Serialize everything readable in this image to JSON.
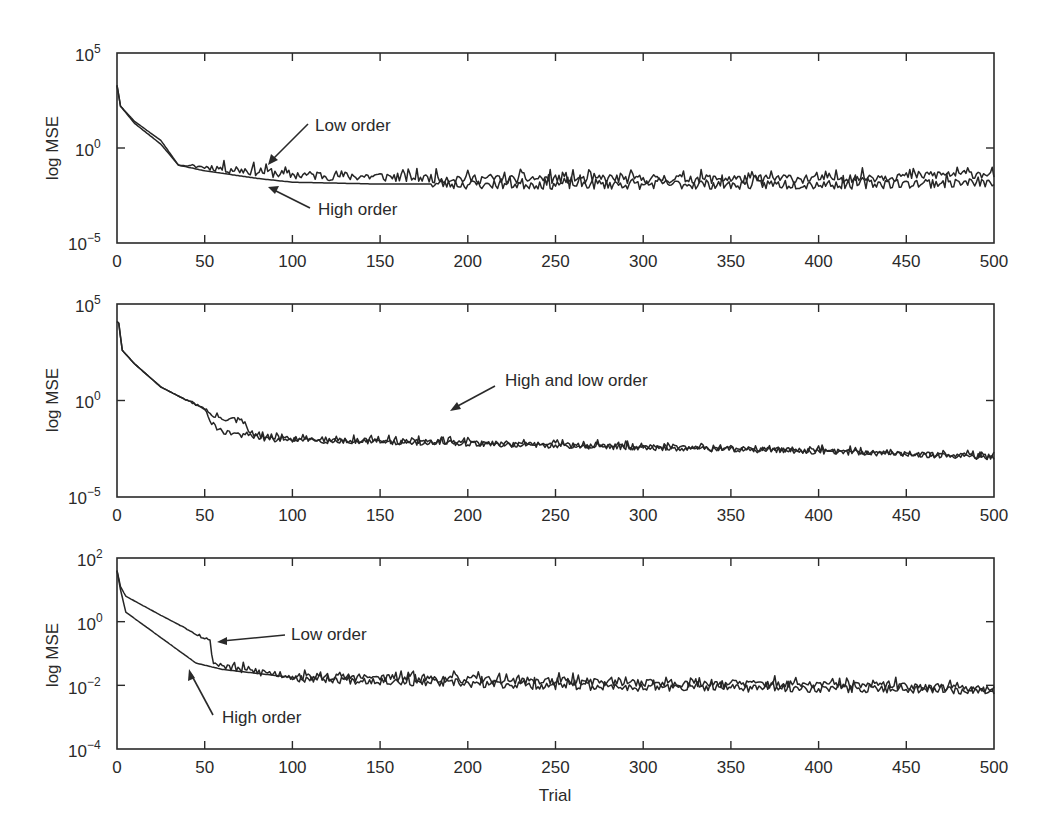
{
  "chart_data": [
    {
      "type": "line",
      "panel": "top",
      "title": "",
      "xlabel": "",
      "ylabel": "log MSE",
      "yscale": "log",
      "xlim": [
        0,
        500
      ],
      "ylim_exp": [
        -5,
        5
      ],
      "xticks": [
        0,
        50,
        100,
        150,
        200,
        250,
        300,
        350,
        400,
        450,
        500
      ],
      "yticks": [
        {
          "exp": 5,
          "label": "10",
          "sup": "5"
        },
        {
          "exp": 0,
          "label": "10",
          "sup": "0"
        },
        {
          "exp": -5,
          "label": "10",
          "sup": "−5"
        }
      ],
      "grid": false,
      "series": [
        {
          "name": "Low order",
          "seed": 11,
          "noise": 0.55,
          "points": [
            [
              0,
              3.3
            ],
            [
              2,
              2.2
            ],
            [
              10,
              1.4
            ],
            [
              25,
              0.4
            ],
            [
              35,
              -0.9
            ],
            [
              50,
              -1.0
            ],
            [
              80,
              -1.2
            ],
            [
              100,
              -1.4
            ],
            [
              150,
              -1.5
            ],
            [
              200,
              -1.6
            ],
            [
              300,
              -1.6
            ],
            [
              400,
              -1.6
            ],
            [
              500,
              -1.3
            ]
          ]
        },
        {
          "name": "High order",
          "seed": 23,
          "noise": 0.0,
          "noise_after": [
            [
              180,
              0.55
            ]
          ],
          "points": [
            [
              0,
              3.3
            ],
            [
              2,
              2.2
            ],
            [
              10,
              1.3
            ],
            [
              25,
              0.2
            ],
            [
              35,
              -0.9
            ],
            [
              50,
              -1.2
            ],
            [
              80,
              -1.6
            ],
            [
              100,
              -1.8
            ],
            [
              150,
              -1.9
            ],
            [
              200,
              -1.9
            ],
            [
              300,
              -1.9
            ],
            [
              400,
              -1.9
            ],
            [
              500,
              -1.8
            ]
          ]
        }
      ],
      "annotations": [
        {
          "text": "Low order",
          "x": 135,
          "y_exp": 2.1
        },
        {
          "text": "High order",
          "x": 133,
          "y_exp": -3.0
        }
      ]
    },
    {
      "type": "line",
      "panel": "middle",
      "title": "",
      "xlabel": "",
      "ylabel": "log MSE",
      "yscale": "log",
      "xlim": [
        0,
        500
      ],
      "ylim_exp": [
        -5,
        5
      ],
      "xticks": [
        0,
        50,
        100,
        150,
        200,
        250,
        300,
        350,
        400,
        450,
        500
      ],
      "yticks": [
        {
          "exp": 5,
          "label": "10",
          "sup": "5"
        },
        {
          "exp": 0,
          "label": "10",
          "sup": "0"
        },
        {
          "exp": -5,
          "label": "10",
          "sup": "−5"
        }
      ],
      "grid": false,
      "series": [
        {
          "name": "Low order",
          "seed": 31,
          "noise": 0.35,
          "points": [
            [
              0,
              4.1
            ],
            [
              1,
              4.0
            ],
            [
              3,
              2.6
            ],
            [
              10,
              1.9
            ],
            [
              25,
              0.7
            ],
            [
              40,
              0.0
            ],
            [
              50,
              -0.4
            ],
            [
              54,
              -0.8
            ],
            [
              72,
              -1.1
            ],
            [
              75,
              -1.6
            ],
            [
              85,
              -2.0
            ],
            [
              150,
              -2.1
            ],
            [
              250,
              -2.3
            ],
            [
              400,
              -2.6
            ],
            [
              500,
              -2.9
            ]
          ]
        },
        {
          "name": "High order",
          "seed": 47,
          "noise": 0.35,
          "points": [
            [
              0,
              4.1
            ],
            [
              1,
              4.0
            ],
            [
              3,
              2.6
            ],
            [
              10,
              1.9
            ],
            [
              25,
              0.7
            ],
            [
              40,
              0.0
            ],
            [
              50,
              -0.4
            ],
            [
              54,
              -1.2
            ],
            [
              60,
              -1.6
            ],
            [
              80,
              -1.9
            ],
            [
              150,
              -2.1
            ],
            [
              250,
              -2.3
            ],
            [
              400,
              -2.6
            ],
            [
              500,
              -2.9
            ]
          ]
        }
      ],
      "annotations": [
        {
          "text": "High and low order",
          "x": 175,
          "y_exp": 0.1
        }
      ]
    },
    {
      "type": "line",
      "panel": "bottom",
      "title": "",
      "xlabel": "Trial",
      "ylabel": "log MSE",
      "yscale": "log",
      "xlim": [
        0,
        500
      ],
      "ylim_exp": [
        -4,
        2
      ],
      "xticks": [
        0,
        50,
        100,
        150,
        200,
        250,
        300,
        350,
        400,
        450,
        500
      ],
      "yticks": [
        {
          "exp": 2,
          "label": "10",
          "sup": "2"
        },
        {
          "exp": 0,
          "label": "10",
          "sup": "0"
        },
        {
          "exp": -2,
          "label": "10",
          "sup": "−2"
        },
        {
          "exp": -4,
          "label": "10",
          "sup": "−4"
        }
      ],
      "grid": false,
      "series": [
        {
          "name": "Low order",
          "seed": 53,
          "noise": 0.28,
          "points": [
            [
              0,
              1.6
            ],
            [
              2,
              1.1
            ],
            [
              5,
              0.8
            ],
            [
              25,
              0.2
            ],
            [
              53,
              -0.6
            ],
            [
              55,
              -1.3
            ],
            [
              70,
              -1.5
            ],
            [
              100,
              -1.7
            ],
            [
              200,
              -1.8
            ],
            [
              300,
              -1.9
            ],
            [
              450,
              -2.0
            ],
            [
              500,
              -2.1
            ]
          ]
        },
        {
          "name": "High order",
          "seed": 67,
          "noise": 0.0,
          "noise_after": [
            [
              100,
              0.28
            ]
          ],
          "points": [
            [
              0,
              1.6
            ],
            [
              2,
              1.0
            ],
            [
              5,
              0.3
            ],
            [
              20,
              -0.3
            ],
            [
              30,
              -0.7
            ],
            [
              45,
              -1.3
            ],
            [
              60,
              -1.5
            ],
            [
              100,
              -1.75
            ],
            [
              200,
              -1.95
            ],
            [
              300,
              -2.05
            ],
            [
              450,
              -2.1
            ],
            [
              500,
              -2.15
            ]
          ]
        }
      ],
      "annotations": [
        {
          "text": "Low order",
          "x": 165,
          "y_exp": 0.3
        },
        {
          "text": "High order",
          "x": 68,
          "y_exp": -2.95
        }
      ]
    }
  ],
  "panels": [
    {
      "ylabel": "log MSE",
      "xticks": [
        "0",
        "50",
        "100",
        "150",
        "200",
        "250",
        "300",
        "350",
        "400",
        "450",
        "500"
      ],
      "yticks": [
        {
          "base": "10",
          "sup": "5"
        },
        {
          "base": "10",
          "sup": "0"
        },
        {
          "base": "10",
          "sup": "−5"
        }
      ],
      "annotations": [
        "Low order",
        "High order"
      ]
    },
    {
      "ylabel": "log MSE",
      "xticks": [
        "0",
        "50",
        "100",
        "150",
        "200",
        "250",
        "300",
        "350",
        "400",
        "450",
        "500"
      ],
      "yticks": [
        {
          "base": "10",
          "sup": "5"
        },
        {
          "base": "10",
          "sup": "0"
        },
        {
          "base": "10",
          "sup": "−5"
        }
      ],
      "annotations": [
        "High and low order"
      ]
    },
    {
      "ylabel": "log MSE",
      "xlabel": "Trial",
      "xticks": [
        "0",
        "50",
        "100",
        "150",
        "200",
        "250",
        "300",
        "350",
        "400",
        "450",
        "500"
      ],
      "yticks": [
        {
          "base": "10",
          "sup": "2"
        },
        {
          "base": "10",
          "sup": "0"
        },
        {
          "base": "10",
          "sup": "−2"
        },
        {
          "base": "10",
          "sup": "−4"
        }
      ],
      "annotations": [
        "Low order",
        "High order"
      ]
    }
  ],
  "colors": {
    "line": "#262626",
    "axis": "#2a2a2a",
    "background": "#ffffff"
  }
}
